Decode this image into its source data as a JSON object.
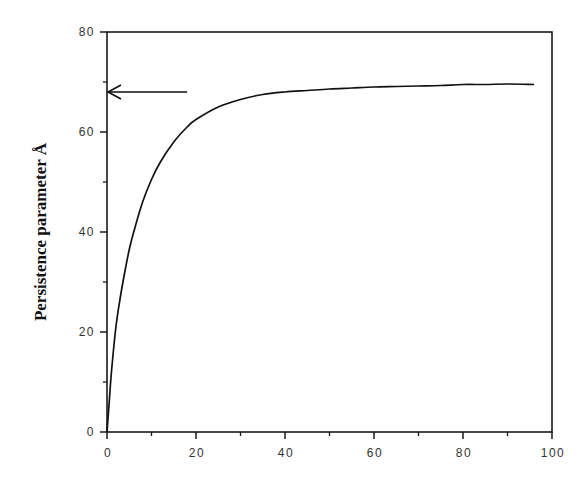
{
  "chart_data": {
    "type": "line",
    "title": "",
    "xlabel": "",
    "ylabel": "Persistence parameter Å",
    "xlim": [
      0,
      100
    ],
    "ylim": [
      0,
      80
    ],
    "x_ticks": [
      0,
      20,
      40,
      60,
      80,
      100
    ],
    "x_tick_labels": [
      "0",
      "20",
      "40",
      "60",
      "80",
      "100"
    ],
    "x_minor_ticks": [
      10,
      30,
      50,
      70,
      90
    ],
    "y_ticks": [
      0,
      20,
      40,
      60,
      80
    ],
    "y_tick_labels": [
      "0",
      "20",
      "40",
      "60",
      "80"
    ],
    "y_minor_ticks": [
      10,
      30,
      50,
      70
    ],
    "grid": false,
    "legend": null,
    "series": [
      {
        "name": "persistence",
        "x": [
          0,
          0.5,
          1,
          2,
          3,
          4,
          5,
          6,
          8,
          10,
          12,
          15,
          18,
          20,
          25,
          30,
          35,
          40,
          45,
          50,
          55,
          60,
          65,
          70,
          75,
          80,
          85,
          90,
          96
        ],
        "y": [
          0,
          6,
          12,
          21,
          27,
          32,
          36.5,
          40,
          46,
          50.5,
          54,
          58,
          61,
          62.5,
          65,
          66.5,
          67.5,
          68,
          68.3,
          68.6,
          68.8,
          69,
          69.1,
          69.2,
          69.3,
          69.5,
          69.5,
          69.6,
          69.5
        ]
      }
    ],
    "annotations": [
      {
        "type": "arrow",
        "from": [
          18,
          68
        ],
        "to": [
          0,
          68
        ],
        "text": ""
      }
    ]
  }
}
